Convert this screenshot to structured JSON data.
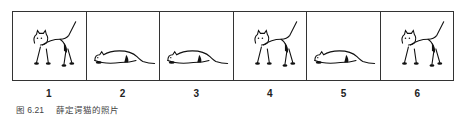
{
  "figure": {
    "panels": [
      {
        "label": "1",
        "pose": "standing"
      },
      {
        "label": "2",
        "pose": "crouching"
      },
      {
        "label": "3",
        "pose": "crouching"
      },
      {
        "label": "4",
        "pose": "standing"
      },
      {
        "label": "5",
        "pose": "crouching"
      },
      {
        "label": "6",
        "pose": "standing"
      }
    ],
    "caption_number": "图 6.21",
    "caption_text": "薛定谔猫的照片"
  }
}
